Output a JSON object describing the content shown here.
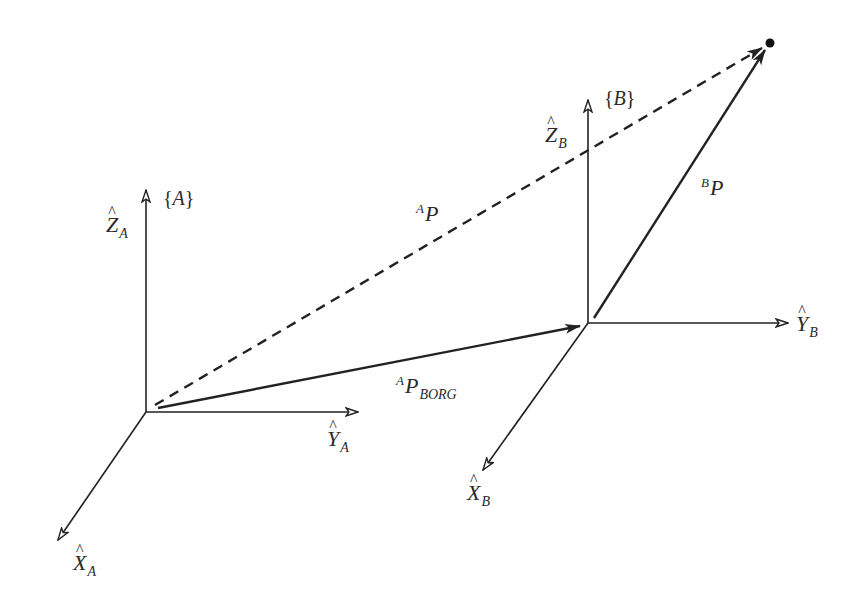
{
  "diagram": {
    "type": "coordinate-frame-vectors",
    "colors": {
      "line": "#222222",
      "text": "#2a2a2a",
      "background": "#ffffff"
    },
    "frames": [
      {
        "name": "A",
        "label": "{A}",
        "label_letter": "A",
        "origin": [
          146,
          412
        ],
        "axes": {
          "z": {
            "end": [
              146,
              190
            ],
            "label": "Z",
            "subscript": "A"
          },
          "y": {
            "end": [
              358,
              412
            ],
            "label": "Y",
            "subscript": "A"
          },
          "x": {
            "end": [
              58,
              540
            ],
            "label": "X",
            "subscript": "A"
          }
        }
      },
      {
        "name": "B",
        "label": "{B}",
        "label_letter": "B",
        "origin": [
          588,
          323
        ],
        "axes": {
          "z": {
            "end": [
              588,
              100
            ],
            "label": "Z",
            "subscript": "B"
          },
          "y": {
            "end": [
              788,
              323
            ],
            "label": "Y",
            "subscript": "B"
          },
          "x": {
            "end": [
              483,
              470
            ],
            "label": "X",
            "subscript": "B"
          }
        }
      }
    ],
    "point": {
      "position": [
        770,
        43
      ]
    },
    "vectors": [
      {
        "id": "A_P_BORG",
        "style": "solid",
        "from": [
          158,
          408
        ],
        "to": [
          580,
          326
        ],
        "superscript": "A",
        "symbol": "P",
        "subscript": "BORG"
      },
      {
        "id": "B_P",
        "style": "solid",
        "from": [
          594,
          318
        ],
        "to": [
          765,
          50
        ],
        "superscript": "B",
        "symbol": "P",
        "subscript": ""
      },
      {
        "id": "A_P",
        "style": "dashed",
        "from": [
          155,
          405
        ],
        "to": [
          762,
          48
        ],
        "superscript": "A",
        "symbol": "P",
        "subscript": ""
      }
    ],
    "hat": "^"
  }
}
